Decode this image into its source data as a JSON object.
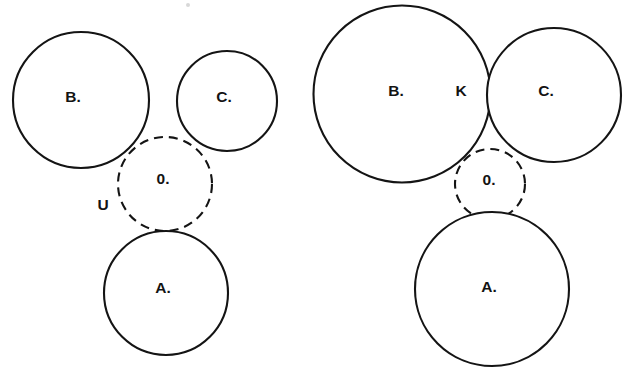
{
  "figure": {
    "background_color": "#ffffff",
    "stroke_color": "#141414",
    "label_color": "#131313",
    "panels": [
      {
        "id": "left-panel",
        "name": "left-configuration",
        "circles": [
          {
            "id": "B",
            "label": "B.",
            "cx": 81,
            "cy": 100,
            "r": 68,
            "style": "solid",
            "label_x": 73,
            "label_y": 98
          },
          {
            "id": "C",
            "label": "C.",
            "cx": 227,
            "cy": 101,
            "r": 50,
            "style": "solid",
            "label_x": 224,
            "label_y": 98
          },
          {
            "id": "O",
            "label": "0.",
            "cx": 165,
            "cy": 184,
            "r": 47,
            "style": "dashed",
            "label_x": 163,
            "label_y": 180
          },
          {
            "id": "A",
            "label": "A.",
            "cx": 166,
            "cy": 293,
            "r": 62,
            "style": "solid",
            "label_x": 163,
            "label_y": 289
          }
        ],
        "point_labels": [
          {
            "id": "U",
            "label": "U",
            "x": 103,
            "y": 206
          }
        ]
      },
      {
        "id": "right-panel",
        "name": "right-configuration",
        "circles": [
          {
            "id": "B",
            "label": "B.",
            "cx": 402,
            "cy": 94,
            "r": 88.5,
            "style": "solid",
            "label_x": 396,
            "label_y": 92
          },
          {
            "id": "C",
            "label": "C.",
            "cx": 554,
            "cy": 95,
            "r": 67,
            "style": "solid",
            "label_x": 546,
            "label_y": 92
          },
          {
            "id": "O",
            "label": "0.",
            "cx": 490,
            "cy": 184,
            "r": 35,
            "style": "dashed",
            "label_x": 489,
            "label_y": 181
          },
          {
            "id": "A",
            "label": "A.",
            "cx": 492,
            "cy": 289,
            "r": 77,
            "style": "solid",
            "label_x": 489,
            "label_y": 288
          }
        ],
        "point_labels": [
          {
            "id": "K",
            "label": "K",
            "x": 461,
            "y": 92
          }
        ]
      }
    ],
    "specks": [
      {
        "x": 188,
        "y": 5,
        "r": 2
      }
    ]
  }
}
